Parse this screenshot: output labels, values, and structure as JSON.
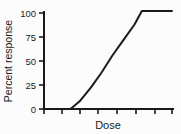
{
  "chart_data": {
    "type": "line",
    "title": "",
    "subtitle": "",
    "xlabel": "Dose",
    "ylabel": "Percent response",
    "ylim": [
      0,
      105
    ],
    "yticks": [
      0,
      25,
      50,
      75,
      100
    ],
    "ytick_labels": [
      "0",
      "25",
      "50",
      "75",
      "100"
    ],
    "xlim": [
      0,
      7
    ],
    "xticks": [
      0,
      1,
      2,
      3,
      4,
      5,
      6,
      7
    ],
    "xtick_labels": [
      "",
      "",
      "",
      "",
      "",
      "",
      "",
      ""
    ],
    "grid": false,
    "legend": false,
    "legend_position": "none",
    "series": [
      {
        "name": "dose-response",
        "color": "#1a1a1a",
        "x": [
          0.35,
          1.45,
          1.95,
          2.55,
          3.15,
          3.75,
          4.35,
          4.95,
          5.35,
          7.0
        ],
        "y": [
          0,
          0,
          8,
          22,
          38,
          56,
          72,
          88,
          102,
          102
        ]
      }
    ],
    "annotations": []
  },
  "figure": {
    "background_color": "#fcfcfc",
    "axis_color": "#1a1a1a",
    "line_color": "#1a1a1a"
  }
}
